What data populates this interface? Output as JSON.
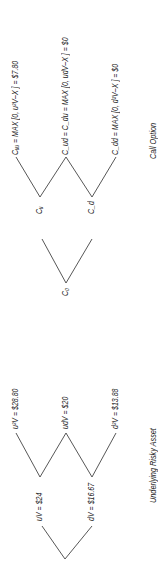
{
  "asset_tree": {
    "caption": "Underlying Risky Asset",
    "nodes": {
      "v0": {
        "label": "V = $20"
      },
      "up": {
        "label": "uV = $24"
      },
      "down": {
        "label": "dV = $16.67"
      },
      "upup": {
        "label": "u²V = $28.80"
      },
      "updown": {
        "label": "udV = $20"
      },
      "downdown": {
        "label": "d²V = $13.88"
      }
    }
  },
  "option_tree": {
    "caption": "Call Option",
    "nodes": {
      "c0": {
        "label": "C₀"
      },
      "cu": {
        "label": "Cᵤ"
      },
      "cd": {
        "label": "C_d"
      },
      "cuu": {
        "label": "Cᵤᵤ = MAX [0, u²V–X ] = $7.80"
      },
      "cud": {
        "label": "C_ud = C_du = MAX [0, udV–X ] = $0"
      },
      "cdd": {
        "label": "C_dd = MAX [0, d²V–X ] = $0"
      }
    }
  }
}
